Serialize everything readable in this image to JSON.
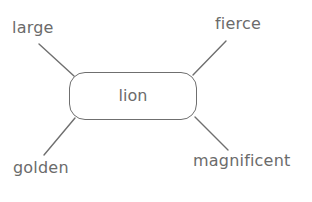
{
  "diagram": {
    "type": "mind-map",
    "center": {
      "label": "lion"
    },
    "branches": [
      {
        "position": "top-left",
        "label": "large"
      },
      {
        "position": "top-right",
        "label": "fierce"
      },
      {
        "position": "bottom-left",
        "label": "golden"
      },
      {
        "position": "bottom-right",
        "label": "magnificent"
      }
    ],
    "colors": {
      "stroke": "#6f6f6f",
      "text": "#6b6b6b",
      "background": "#ffffff"
    }
  }
}
